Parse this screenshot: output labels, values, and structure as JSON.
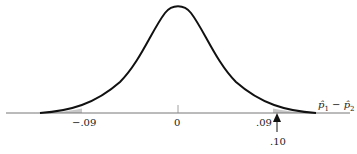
{
  "figure": {
    "type": "normal-distribution-diagram",
    "variable_label": "p̂₁ − p̂₂",
    "variable_label_parts": {
      "p1": "p̂",
      "sub1": "1",
      "minus": " − ",
      "p2": "p̂",
      "sub2": "2"
    },
    "ticks": [
      {
        "value": -0.09,
        "label": "−.09"
      },
      {
        "value": 0,
        "label": "0"
      },
      {
        "value": 0.09,
        "label": ".09"
      }
    ],
    "shaded_tails": {
      "left_bound": "−.09",
      "right_bound": ".09",
      "fill": "#c8c8c8"
    },
    "arrow": {
      "points_to": 0.1,
      "label": ".10"
    },
    "colors": {
      "curve": "#111111",
      "axis": "#777777",
      "shade": "#c8c8c8"
    }
  }
}
